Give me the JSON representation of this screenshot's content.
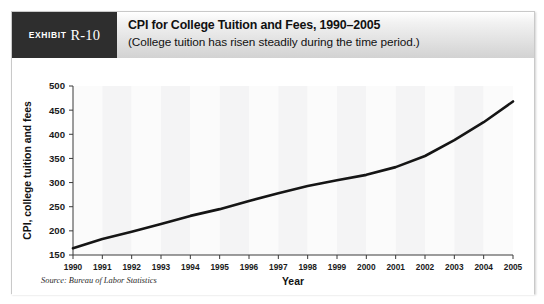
{
  "exhibit": {
    "label_word": "Exhibit",
    "label_number": "R-10"
  },
  "header": {
    "title": "CPI for College Tuition and Fees, 1990–2005",
    "subtitle": "(College tuition has risen steadily during the time period.)"
  },
  "source": {
    "text": "Source: Bureau of Labor Statistics"
  },
  "chart_data": {
    "type": "line",
    "title": "CPI for College Tuition and Fees, 1990–2005",
    "subtitle": "(College tuition has risen steadily during the time period.)",
    "xlabel": "Year",
    "ylabel": "CPI, college tuition and fees",
    "x": [
      1990,
      1991,
      1992,
      1993,
      1994,
      1995,
      1996,
      1997,
      1998,
      1999,
      2000,
      2001,
      2002,
      2003,
      2004,
      2005
    ],
    "categories": [
      "1990",
      "1991",
      "1992",
      "1993",
      "1994",
      "1995",
      "1996",
      "1997",
      "1998",
      "1999",
      "2000",
      "2001",
      "2002",
      "2003",
      "2004",
      "2005"
    ],
    "values": [
      164,
      183,
      198,
      214,
      231,
      245,
      262,
      278,
      293,
      305,
      316,
      332,
      355,
      388,
      425,
      468
    ],
    "series": [
      {
        "name": "CPI, college tuition and fees",
        "values": [
          164,
          183,
          198,
          214,
          231,
          245,
          262,
          278,
          293,
          305,
          316,
          332,
          355,
          388,
          425,
          468
        ]
      }
    ],
    "ylim": [
      150,
      500
    ],
    "yticks": [
      150,
      200,
      250,
      300,
      350,
      400,
      450,
      500
    ],
    "ytick_labels": [
      "150",
      "200",
      "250",
      "300",
      "350",
      "400",
      "450",
      "500"
    ],
    "xtick_labels": [
      "1990",
      "1991",
      "1992",
      "1993",
      "1994",
      "1995",
      "1996",
      "1997",
      "1998",
      "1999",
      "2000",
      "2001",
      "2002",
      "2003",
      "2004",
      "2005"
    ],
    "xlim": [
      1990,
      2005
    ],
    "grid": false,
    "legend": "none",
    "line_color": "#151515",
    "band_shading": true,
    "source": "Source: Bureau of Labor Statistics"
  }
}
